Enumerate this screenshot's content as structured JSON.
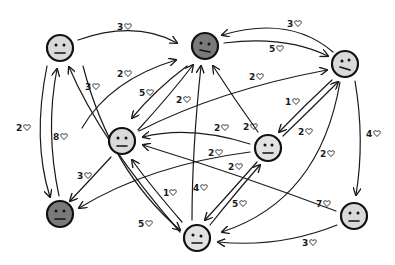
{
  "diagram": {
    "type": "directed-graph",
    "unit_icon": "heart-icon",
    "colors": {
      "light_face": "#d9d9d9",
      "dark_face": "#7a7a7a",
      "stroke": "#1a1a1a",
      "background": "#ffffff"
    },
    "nodes": [
      {
        "id": "A",
        "shade": "light",
        "x": 60,
        "y": 48
      },
      {
        "id": "B",
        "shade": "dark",
        "x": 205,
        "y": 46
      },
      {
        "id": "C",
        "shade": "light",
        "x": 345,
        "y": 64
      },
      {
        "id": "D",
        "shade": "light",
        "x": 122,
        "y": 141
      },
      {
        "id": "E",
        "shade": "light",
        "x": 268,
        "y": 148
      },
      {
        "id": "F",
        "shade": "dark",
        "x": 60,
        "y": 214
      },
      {
        "id": "G",
        "shade": "light",
        "x": 197,
        "y": 238
      },
      {
        "id": "H",
        "shade": "light",
        "x": 354,
        "y": 216
      }
    ],
    "edges": [
      {
        "from": "A",
        "to": "B",
        "weight": "3"
      },
      {
        "from": "C",
        "to": "B",
        "weight": "3"
      },
      {
        "from": "B",
        "to": "C",
        "weight": "5"
      },
      {
        "from": "D",
        "to": "B",
        "weight": "2"
      },
      {
        "from": "B",
        "to": "D",
        "weight": "5"
      },
      {
        "from": "D",
        "to": "B",
        "weight": "2"
      },
      {
        "from": "D",
        "to": "C",
        "weight": "2"
      },
      {
        "from": "G",
        "to": "A",
        "weight": "3"
      },
      {
        "from": "A",
        "to": "F",
        "weight": "2"
      },
      {
        "from": "F",
        "to": "A",
        "weight": "8"
      },
      {
        "from": "D",
        "to": "F",
        "weight": "3"
      },
      {
        "from": "E",
        "to": "F",
        "weight": "2"
      },
      {
        "from": "C",
        "to": "E",
        "weight": "1"
      },
      {
        "from": "E",
        "to": "C",
        "weight": "2"
      },
      {
        "from": "E",
        "to": "B",
        "weight": "2"
      },
      {
        "from": "E",
        "to": "D",
        "weight": "2"
      },
      {
        "from": "H",
        "to": "D",
        "weight": "7"
      },
      {
        "from": "E",
        "to": "G",
        "weight": "2"
      },
      {
        "from": "G",
        "to": "E",
        "weight": "5"
      },
      {
        "from": "G",
        "to": "D",
        "weight": "1"
      },
      {
        "from": "G",
        "to": "B",
        "weight": "4"
      },
      {
        "from": "A",
        "to": "G",
        "weight": "5"
      },
      {
        "from": "C",
        "to": "G",
        "weight": "2"
      },
      {
        "from": "C",
        "to": "H",
        "weight": "4"
      },
      {
        "from": "H",
        "to": "G",
        "weight": "3"
      }
    ]
  }
}
